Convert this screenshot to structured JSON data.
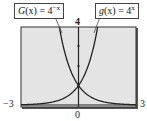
{
  "chart_data": {
    "type": "line",
    "title": "",
    "xlabel": "",
    "ylabel": "",
    "xlim": [
      -3,
      3
    ],
    "ylim": [
      0,
      4
    ],
    "grid": false,
    "series": [
      {
        "name": "G(x) = 4^-x",
        "function": "4^(-x)",
        "x": [
          -3,
          -2,
          -1.5,
          -1,
          -0.5,
          0,
          0.5,
          1,
          2,
          3
        ],
        "y": [
          64,
          16,
          8,
          4,
          2,
          1,
          0.5,
          0.25,
          0.0625,
          0.015625
        ]
      },
      {
        "name": "g(x) = 4^x",
        "function": "4^x",
        "x": [
          -3,
          -2,
          -1,
          -0.5,
          0,
          0.5,
          1,
          1.5,
          2,
          3
        ],
        "y": [
          0.015625,
          0.0625,
          0.25,
          0.5,
          1,
          2,
          4,
          8,
          16,
          64
        ]
      }
    ],
    "tick_labels": {
      "x_min": "−3",
      "x_max": "3",
      "y_max": "4",
      "y_min": "0"
    },
    "annotations": [
      {
        "text": "G(x) = 4^−x",
        "points_to": "G curve"
      },
      {
        "text": "g(x) = 4^x",
        "points_to": "g curve"
      }
    ]
  },
  "labels": {
    "x_min": "−3",
    "x_max": "3",
    "y_max": "4",
    "y_min": "0",
    "callout_left_func": "G",
    "callout_left_eq": "(x) = 4",
    "callout_left_exp": "−x",
    "callout_right_func": "g",
    "callout_right_eq": "(x) = 4",
    "callout_right_exp": "x"
  },
  "colors": {
    "plot_bg": "#e4e4e4",
    "frame": "#333333",
    "curve": "#222222"
  }
}
